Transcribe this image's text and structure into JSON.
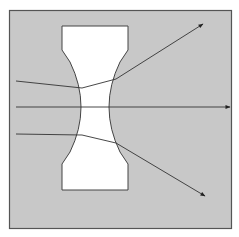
{
  "diagram": {
    "title": "",
    "colors": {
      "background": "#ffffff",
      "panel": "#c8c8c8",
      "panel_border": "#555555",
      "lens_fill": "#ffffff",
      "lens_stroke": "#444444",
      "ray": "#333333"
    },
    "elements": [
      {
        "type": "panel",
        "name": "gray-frame"
      },
      {
        "type": "lens",
        "name": "concave-lens"
      },
      {
        "type": "ray",
        "name": "upper-ray",
        "direction": "diverges upward"
      },
      {
        "type": "ray",
        "name": "center-ray",
        "direction": "passes straight through"
      },
      {
        "type": "ray",
        "name": "lower-ray",
        "direction": "diverges downward"
      }
    ]
  }
}
